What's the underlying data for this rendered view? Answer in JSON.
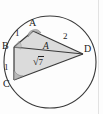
{
  "figure": {
    "kind": "cyclic-quadrilateral-geometry-diagram",
    "vertices": {
      "a": "A",
      "b": "B",
      "c": "C",
      "d": "D"
    },
    "side_labels": {
      "ab": "1",
      "bc": "1",
      "ad": "2"
    },
    "interior_label": "A",
    "diagonal_label": {
      "radical": "√",
      "radicand": "7",
      "full": "√7"
    },
    "colors": {
      "stroke": "#3a3a3a",
      "fill": "#d9d9d9",
      "angle_fill": "#b5b5b5",
      "text": "#222222",
      "background": "#fdfdfd",
      "rule": "#e2e2e2"
    },
    "geometry": {
      "circle_center_x": 50,
      "circle_center_y": 62,
      "circle_radius": 46,
      "point_a_x": 33,
      "point_a_y": 31,
      "point_b_x": 14,
      "point_b_y": 47,
      "point_c_x": 14,
      "point_c_y": 80,
      "point_d_x": 83,
      "point_d_y": 54
    }
  }
}
